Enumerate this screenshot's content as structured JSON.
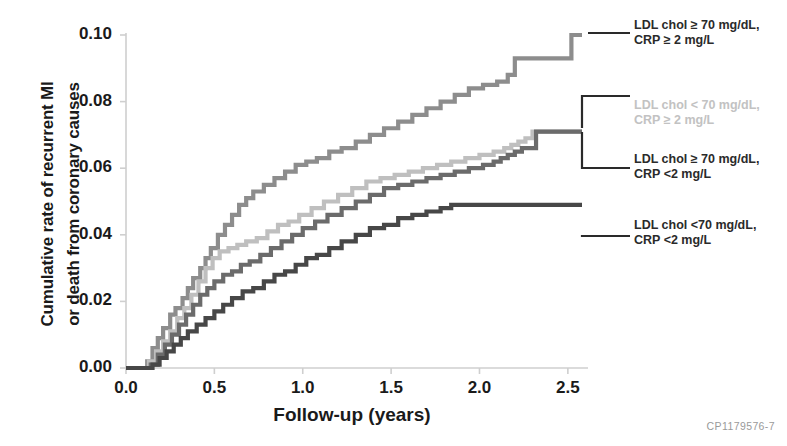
{
  "figure": {
    "code_label": "CP1179576-7",
    "axis_color": "#cfcfcf",
    "text_color": "#1a1a1a"
  },
  "chart_data": {
    "type": "line",
    "title": "",
    "xlabel": "Follow-up (years)",
    "ylabel_line1": "Cumulative rate of recurrent MI",
    "ylabel_line2": "or death from coronary causes",
    "xlim": [
      0.0,
      2.58
    ],
    "ylim": [
      0.0,
      0.1
    ],
    "xticks": [
      "0.0",
      "0.5",
      "1.0",
      "1.5",
      "2.0",
      "2.5"
    ],
    "xtick_values": [
      0.0,
      0.5,
      1.0,
      1.5,
      2.0,
      2.5
    ],
    "yticks": [
      "0.00",
      "0.02",
      "0.04",
      "0.06",
      "0.08",
      "0.10"
    ],
    "ytick_values": [
      0.0,
      0.02,
      0.04,
      0.06,
      0.08,
      0.1
    ],
    "grid": false,
    "legend_position": "right",
    "series": [
      {
        "name": "LDL chol ≥ 70 mg/dL, CRP ≥ 2 mg/L",
        "label_line1": "LDL chol ≥ 70 mg/dL,",
        "label_line2": "CRP ≥ 2 mg/L",
        "color": "#8d8d8d",
        "final_value": 0.1,
        "x": [
          0.0,
          0.08,
          0.12,
          0.15,
          0.18,
          0.21,
          0.25,
          0.28,
          0.32,
          0.35,
          0.38,
          0.42,
          0.45,
          0.48,
          0.52,
          0.56,
          0.6,
          0.64,
          0.68,
          0.72,
          0.78,
          0.84,
          0.9,
          0.96,
          1.02,
          1.08,
          1.15,
          1.22,
          1.3,
          1.38,
          1.46,
          1.54,
          1.62,
          1.7,
          1.78,
          1.86,
          1.94,
          2.02,
          2.1,
          2.16,
          2.2,
          2.28,
          2.36,
          2.44,
          2.5,
          2.52,
          2.58
        ],
        "y": [
          0.0,
          0.0,
          0.002,
          0.006,
          0.009,
          0.012,
          0.016,
          0.018,
          0.021,
          0.024,
          0.027,
          0.03,
          0.033,
          0.036,
          0.04,
          0.043,
          0.046,
          0.049,
          0.051,
          0.053,
          0.055,
          0.057,
          0.059,
          0.061,
          0.062,
          0.063,
          0.065,
          0.066,
          0.068,
          0.07,
          0.072,
          0.074,
          0.076,
          0.078,
          0.08,
          0.082,
          0.084,
          0.085,
          0.086,
          0.088,
          0.093,
          0.093,
          0.093,
          0.093,
          0.093,
          0.1,
          0.1
        ]
      },
      {
        "name": "LDL chol < 70 mg/dL, CRP ≥ 2 mg/L",
        "label_line1": "LDL chol < 70 mg/dL,",
        "label_line2": "CRP ≥ 2 mg/L",
        "color": "#bfbfbf",
        "final_value": 0.071,
        "x": [
          0.0,
          0.08,
          0.13,
          0.17,
          0.21,
          0.25,
          0.29,
          0.33,
          0.37,
          0.41,
          0.45,
          0.49,
          0.53,
          0.58,
          0.63,
          0.68,
          0.74,
          0.8,
          0.86,
          0.92,
          0.98,
          1.05,
          1.12,
          1.2,
          1.28,
          1.36,
          1.44,
          1.52,
          1.6,
          1.68,
          1.76,
          1.84,
          1.92,
          2.0,
          2.08,
          2.14,
          2.18,
          2.22,
          2.26,
          2.3,
          2.34,
          2.4,
          2.46,
          2.52,
          2.58
        ],
        "y": [
          0.0,
          0.0,
          0.002,
          0.005,
          0.008,
          0.011,
          0.015,
          0.018,
          0.022,
          0.026,
          0.03,
          0.033,
          0.035,
          0.036,
          0.037,
          0.038,
          0.039,
          0.041,
          0.043,
          0.044,
          0.046,
          0.048,
          0.05,
          0.052,
          0.054,
          0.056,
          0.057,
          0.058,
          0.059,
          0.06,
          0.061,
          0.062,
          0.063,
          0.064,
          0.065,
          0.066,
          0.067,
          0.068,
          0.069,
          0.071,
          0.071,
          0.071,
          0.071,
          0.071,
          0.071
        ]
      },
      {
        "name": "LDL chol ≥ 70 mg/dL, CRP <2 mg/L",
        "label_line1": "LDL chol ≥ 70 mg/dL,",
        "label_line2": "CRP <2 mg/L",
        "color": "#6b6b6b",
        "final_value": 0.071,
        "x": [
          0.0,
          0.09,
          0.14,
          0.18,
          0.22,
          0.26,
          0.3,
          0.34,
          0.38,
          0.42,
          0.46,
          0.5,
          0.55,
          0.6,
          0.65,
          0.7,
          0.76,
          0.82,
          0.88,
          0.94,
          1.0,
          1.07,
          1.14,
          1.22,
          1.3,
          1.38,
          1.46,
          1.54,
          1.62,
          1.7,
          1.78,
          1.86,
          1.94,
          2.02,
          2.08,
          2.12,
          2.16,
          2.2,
          2.24,
          2.28,
          2.32,
          2.38,
          2.46,
          2.52,
          2.58
        ],
        "y": [
          0.0,
          0.0,
          0.001,
          0.004,
          0.007,
          0.01,
          0.013,
          0.016,
          0.019,
          0.022,
          0.024,
          0.026,
          0.028,
          0.029,
          0.031,
          0.032,
          0.034,
          0.036,
          0.038,
          0.04,
          0.042,
          0.044,
          0.046,
          0.048,
          0.05,
          0.052,
          0.054,
          0.055,
          0.056,
          0.057,
          0.058,
          0.059,
          0.06,
          0.061,
          0.062,
          0.063,
          0.064,
          0.065,
          0.066,
          0.066,
          0.071,
          0.071,
          0.071,
          0.071,
          0.071
        ]
      },
      {
        "name": "LDL chol <70 mg/dL, CRP <2 mg/L",
        "label_line1": "LDL chol <70 mg/dL,",
        "label_line2": "CRP <2 mg/L",
        "color": "#474747",
        "final_value": 0.049,
        "x": [
          0.0,
          0.1,
          0.15,
          0.19,
          0.23,
          0.27,
          0.31,
          0.35,
          0.4,
          0.45,
          0.5,
          0.55,
          0.6,
          0.66,
          0.72,
          0.78,
          0.84,
          0.9,
          0.96,
          1.02,
          1.08,
          1.15,
          1.22,
          1.3,
          1.38,
          1.46,
          1.54,
          1.62,
          1.7,
          1.78,
          1.84,
          1.9,
          2.0,
          2.1,
          2.2,
          2.3,
          2.4,
          2.5,
          2.58
        ],
        "y": [
          0.0,
          0.0,
          0.001,
          0.003,
          0.005,
          0.007,
          0.009,
          0.011,
          0.013,
          0.015,
          0.017,
          0.019,
          0.021,
          0.023,
          0.024,
          0.026,
          0.028,
          0.029,
          0.031,
          0.033,
          0.034,
          0.036,
          0.038,
          0.04,
          0.042,
          0.043,
          0.045,
          0.046,
          0.047,
          0.048,
          0.049,
          0.049,
          0.049,
          0.049,
          0.049,
          0.049,
          0.049,
          0.049,
          0.049
        ]
      }
    ]
  }
}
